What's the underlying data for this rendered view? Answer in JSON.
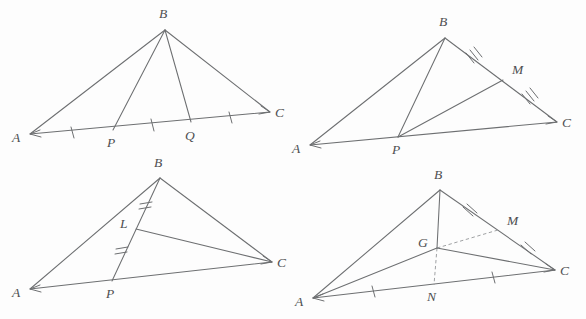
{
  "document": {
    "kind": "geometry-figure-sheet",
    "background_color": "#fdfdfd",
    "line_color": "#6d6f71",
    "label_color": "#4d4f51",
    "dashed_color": "#9a9c9e",
    "panel_count": 4
  },
  "panels": [
    {
      "id": "panel-1",
      "name": "triangle-abc-trisected-base",
      "caption": "",
      "vertices": {
        "A": {
          "label": "A",
          "x": 30,
          "y": 134,
          "label_x": 12,
          "label_y": 138
        },
        "B": {
          "label": "B",
          "x": 165,
          "y": 30,
          "label_x": 160,
          "label_y": 17
        },
        "C": {
          "label": "C",
          "x": 270,
          "y": 112,
          "label_x": 274,
          "label_y": 116
        },
        "P": {
          "label": "P",
          "x": 113,
          "y": 130,
          "label_x": 108,
          "label_y": 146
        },
        "Q": {
          "label": "Q",
          "x": 191,
          "y": 122,
          "label_x": 186,
          "label_y": 139
        }
      },
      "edges": [
        {
          "name": "side-ab",
          "from": "A",
          "to": "B",
          "style": "solid"
        },
        {
          "name": "side-bc",
          "from": "B",
          "to": "C",
          "style": "solid"
        },
        {
          "name": "side-ac",
          "from": "A",
          "to": "C",
          "style": "solid"
        },
        {
          "name": "cevian-bp",
          "from": "B",
          "to": "P",
          "style": "solid"
        },
        {
          "name": "cevian-bq",
          "from": "B",
          "to": "Q",
          "style": "solid"
        }
      ],
      "tick_marks": [
        {
          "name": "tick-ap",
          "on": "A-P",
          "count": 1
        },
        {
          "name": "tick-pq",
          "on": "P-Q",
          "count": 1
        },
        {
          "name": "tick-qc",
          "on": "Q-C",
          "count": 1
        }
      ]
    },
    {
      "id": "panel-2",
      "name": "triangle-abc-midpoint-m-cevian-pm",
      "caption": "",
      "vertices": {
        "A": {
          "label": "A",
          "x": 310,
          "y": 145,
          "label_x": 292,
          "label_y": 149
        },
        "B": {
          "label": "B",
          "x": 445,
          "y": 38,
          "label_x": 440,
          "label_y": 25
        },
        "C": {
          "label": "C",
          "x": 557,
          "y": 122,
          "label_x": 561,
          "label_y": 126
        },
        "P": {
          "label": "P",
          "x": 398,
          "y": 137,
          "label_x": 393,
          "label_y": 153
        },
        "M": {
          "label": "M",
          "x": 503,
          "y": 80,
          "label_x": 513,
          "label_y": 73
        }
      },
      "edges": [
        {
          "name": "side-ab",
          "from": "A",
          "to": "B",
          "style": "solid"
        },
        {
          "name": "side-bc",
          "from": "B",
          "to": "C",
          "style": "solid"
        },
        {
          "name": "side-ac",
          "from": "A",
          "to": "C",
          "style": "solid"
        },
        {
          "name": "cevian-bp",
          "from": "B",
          "to": "P",
          "style": "solid"
        },
        {
          "name": "segment-pm",
          "from": "P",
          "to": "M",
          "style": "solid"
        }
      ],
      "tick_marks": [
        {
          "name": "tick-bm",
          "on": "B-M",
          "count": 3
        },
        {
          "name": "tick-mc",
          "on": "M-C",
          "count": 3
        }
      ]
    },
    {
      "id": "panel-3",
      "name": "triangle-abc-point-l-on-bp-segment-lc",
      "caption": "",
      "vertices": {
        "A": {
          "label": "A",
          "x": 30,
          "y": 289,
          "label_x": 13,
          "label_y": 293
        },
        "B": {
          "label": "B",
          "x": 160,
          "y": 178,
          "label_x": 155,
          "label_y": 166
        },
        "C": {
          "label": "C",
          "x": 272,
          "y": 262,
          "label_x": 276,
          "label_y": 266
        },
        "P": {
          "label": "P",
          "x": 112,
          "y": 281,
          "label_x": 107,
          "label_y": 297
        },
        "L": {
          "label": "L",
          "x": 136,
          "y": 228,
          "label_x": 122,
          "label_y": 227
        }
      },
      "edges": [
        {
          "name": "side-ab",
          "from": "A",
          "to": "B",
          "style": "solid"
        },
        {
          "name": "side-bc",
          "from": "B",
          "to": "C",
          "style": "solid"
        },
        {
          "name": "side-ac",
          "from": "A",
          "to": "C",
          "style": "solid"
        },
        {
          "name": "cevian-bp",
          "from": "B",
          "to": "P",
          "style": "solid"
        },
        {
          "name": "segment-lc",
          "from": "L",
          "to": "C",
          "style": "solid"
        }
      ],
      "tick_marks": [
        {
          "name": "tick-bl",
          "on": "B-L",
          "count": 2
        },
        {
          "name": "tick-lp",
          "on": "L-P",
          "count": 2
        }
      ]
    },
    {
      "id": "panel-4",
      "name": "triangle-abc-centroid-g-medians",
      "caption": "",
      "vertices": {
        "A": {
          "label": "A",
          "x": 313,
          "y": 298,
          "label_x": 296,
          "label_y": 302
        },
        "B": {
          "label": "B",
          "x": 440,
          "y": 190,
          "label_x": 435,
          "label_y": 177
        },
        "C": {
          "label": "C",
          "x": 555,
          "y": 270,
          "label_x": 559,
          "label_y": 274
        },
        "M": {
          "label": "M",
          "x": 498,
          "y": 230,
          "label_x": 508,
          "label_y": 224
        },
        "N": {
          "label": "N",
          "x": 434,
          "y": 284,
          "label_x": 428,
          "label_y": 300
        },
        "G": {
          "label": "G",
          "x": 437,
          "y": 248,
          "label_x": 420,
          "label_y": 246
        }
      },
      "edges": [
        {
          "name": "side-ab",
          "from": "A",
          "to": "B",
          "style": "solid"
        },
        {
          "name": "side-bc",
          "from": "B",
          "to": "C",
          "style": "solid"
        },
        {
          "name": "side-ac",
          "from": "A",
          "to": "C",
          "style": "solid"
        },
        {
          "name": "median-bn-upper",
          "from": "B",
          "to": "G",
          "style": "solid"
        },
        {
          "name": "median-gn-lower",
          "from": "G",
          "to": "N",
          "style": "dashed"
        },
        {
          "name": "median-gm",
          "from": "G",
          "to": "M",
          "style": "dashed"
        },
        {
          "name": "segment-ag",
          "from": "A",
          "to": "G",
          "style": "solid"
        },
        {
          "name": "segment-gc",
          "from": "G",
          "to": "C",
          "style": "solid"
        }
      ],
      "tick_marks": [
        {
          "name": "tick-bm",
          "on": "B-M",
          "count": 2
        },
        {
          "name": "tick-mc",
          "on": "M-C",
          "count": 2
        },
        {
          "name": "tick-an",
          "on": "A-N",
          "count": 1
        },
        {
          "name": "tick-nc",
          "on": "N-C",
          "count": 1
        }
      ]
    }
  ]
}
